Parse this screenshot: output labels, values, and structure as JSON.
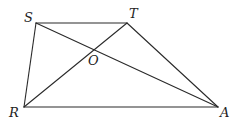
{
  "diagram": {
    "type": "geometry",
    "points": {
      "S": {
        "label": "S",
        "x": 36,
        "y": 23,
        "lx": 24,
        "ly": 22
      },
      "T": {
        "label": "T",
        "x": 127,
        "y": 23,
        "lx": 129,
        "ly": 18
      },
      "R": {
        "label": "R",
        "x": 24,
        "y": 107,
        "lx": 9,
        "ly": 117
      },
      "A": {
        "label": "A",
        "x": 218,
        "y": 107,
        "lx": 220,
        "ly": 117
      },
      "O": {
        "label": "O",
        "x": 93,
        "y": 50,
        "lx": 88,
        "ly": 65
      }
    },
    "segments": [
      {
        "from": "S",
        "to": "T",
        "name": "segment-ST"
      },
      {
        "from": "S",
        "to": "R",
        "name": "segment-SR"
      },
      {
        "from": "R",
        "to": "A",
        "name": "segment-RA"
      },
      {
        "from": "T",
        "to": "A",
        "name": "segment-TA"
      },
      {
        "from": "S",
        "to": "A",
        "name": "segment-SA"
      },
      {
        "from": "R",
        "to": "T",
        "name": "segment-RT"
      }
    ],
    "stroke_color": "#2a2a2a",
    "label_color": "#222222"
  }
}
